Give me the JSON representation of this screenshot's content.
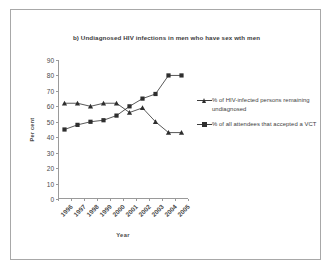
{
  "figure": {
    "title": "b) Undiagnosed HIV infections in men who have sex wth men",
    "x_axis_title": "Year",
    "y_axis_title": "Per cent"
  },
  "legend": {
    "entries": [
      {
        "marker": "triangle-marker",
        "label": "% of HIV-infected persons remaining undiagnosed"
      },
      {
        "marker": "square-marker",
        "label": "% of all attendees that accepted a VCT"
      }
    ]
  },
  "chart_data": {
    "type": "line",
    "title": "b) Undiagnosed HIV infections in men who have sex wth men",
    "xlabel": "Year",
    "ylabel": "Per cent",
    "categories": [
      "1996",
      "1997",
      "1998",
      "1999",
      "2000",
      "2001",
      "2002",
      "2003",
      "2004",
      "2005"
    ],
    "ylim": [
      0,
      90
    ],
    "yticks": [
      0,
      10,
      20,
      30,
      40,
      50,
      60,
      70,
      80,
      90
    ],
    "grid": false,
    "legend_position": "right",
    "series": [
      {
        "name": "% of HIV-infected persons remaining undiagnosed",
        "marker": "triangle",
        "color": "#2e2e2e",
        "values": [
          62,
          62,
          60,
          62,
          62,
          56,
          59,
          50,
          43,
          43
        ]
      },
      {
        "name": "% of all attendees that accepted a VCT",
        "marker": "square",
        "color": "#2e2e2e",
        "values": [
          45,
          48,
          50,
          51,
          54,
          60,
          65,
          68,
          80,
          80
        ]
      }
    ]
  }
}
